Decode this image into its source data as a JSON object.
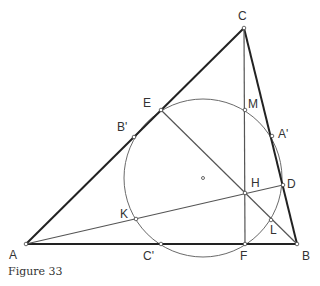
{
  "figure": {
    "caption": "Figure 33",
    "colors": {
      "triangle": "#222222",
      "circle": "#666666",
      "lines": "#555555",
      "labels": "#333333"
    },
    "points": {
      "A": {
        "label": "A",
        "x": 26,
        "y": 244
      },
      "B": {
        "label": "B",
        "x": 297,
        "y": 244
      },
      "C": {
        "label": "C",
        "x": 244,
        "y": 28
      },
      "D": {
        "label": "D",
        "x": 283,
        "y": 185
      },
      "E": {
        "label": "E",
        "x": 161,
        "y": 110
      },
      "F": {
        "label": "F",
        "x": 245,
        "y": 244
      },
      "H": {
        "label": "H",
        "x": 245,
        "y": 193
      },
      "K": {
        "label": "K",
        "x": 136,
        "y": 219
      },
      "L": {
        "label": "L",
        "x": 271,
        "y": 220
      },
      "M": {
        "label": "M",
        "x": 245,
        "y": 110
      },
      "A_prime": {
        "label": "A'",
        "x": 272,
        "y": 136
      },
      "B_prime": {
        "label": "B'",
        "x": 134,
        "y": 137
      },
      "C_prime": {
        "label": "C'",
        "x": 161,
        "y": 244
      },
      "center": {
        "x": 203,
        "y": 178
      }
    },
    "circle": {
      "cx": 203,
      "cy": 178,
      "r": 79
    }
  }
}
